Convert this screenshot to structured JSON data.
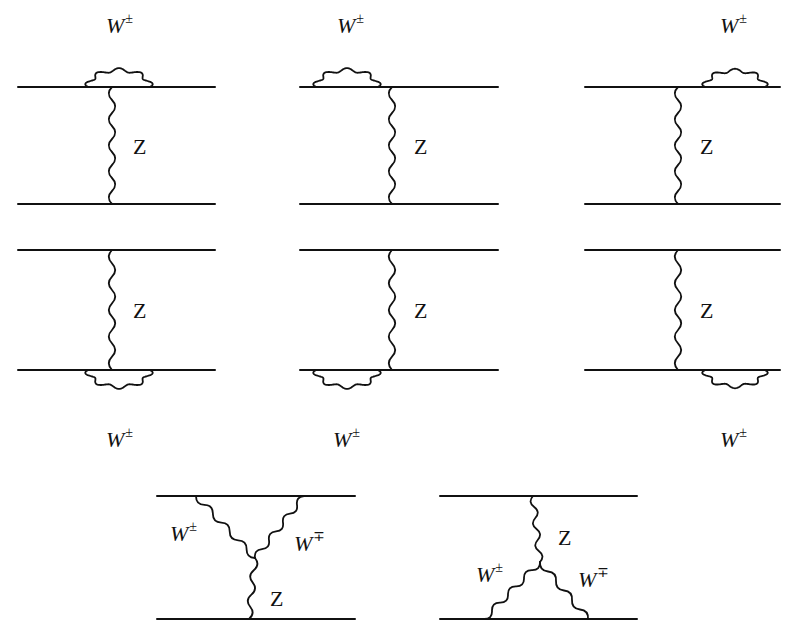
{
  "figure": {
    "stroke_color": "#111111",
    "background": "#ffffff"
  },
  "labels": {
    "w_pm": "W",
    "w_pm_sup": "±",
    "w_mp_sup": "∓",
    "z": "Z"
  },
  "diagrams": [
    {
      "id": "d1",
      "type": "self-energy",
      "x0": 18,
      "x1": 215,
      "yTop": 87,
      "yBot": 204,
      "zx": 112,
      "loop": {
        "line": "top",
        "xa": 88,
        "xb": 150,
        "side": "up"
      },
      "wLabel": {
        "x": 106,
        "y": 14
      },
      "zLabel": {
        "x": 133,
        "y": 136
      }
    },
    {
      "id": "d2",
      "type": "self-energy",
      "x0": 300,
      "x1": 498,
      "yTop": 87,
      "yBot": 204,
      "zx": 392,
      "loop": {
        "line": "top",
        "xa": 316,
        "xb": 378,
        "side": "up"
      },
      "wLabel": {
        "x": 337,
        "y": 14
      },
      "zLabel": {
        "x": 414,
        "y": 136
      }
    },
    {
      "id": "d3",
      "type": "self-energy",
      "x0": 585,
      "x1": 780,
      "yTop": 87,
      "yBot": 204,
      "zx": 678,
      "loop": {
        "line": "top",
        "xa": 705,
        "xb": 765,
        "side": "up"
      },
      "wLabel": {
        "x": 720,
        "y": 14
      },
      "zLabel": {
        "x": 700,
        "y": 136
      }
    },
    {
      "id": "d4",
      "type": "self-energy",
      "x0": 18,
      "x1": 215,
      "yTop": 250,
      "yBot": 370,
      "zx": 112,
      "loop": {
        "line": "bottom",
        "xa": 88,
        "xb": 150,
        "side": "down"
      },
      "wLabel": {
        "x": 106,
        "y": 428
      },
      "zLabel": {
        "x": 133,
        "y": 300
      }
    },
    {
      "id": "d5",
      "type": "self-energy",
      "x0": 300,
      "x1": 498,
      "yTop": 250,
      "yBot": 370,
      "zx": 392,
      "loop": {
        "line": "bottom",
        "xa": 316,
        "xb": 378,
        "side": "down"
      },
      "wLabel": {
        "x": 333,
        "y": 428
      },
      "zLabel": {
        "x": 414,
        "y": 300
      }
    },
    {
      "id": "d6",
      "type": "self-energy",
      "x0": 585,
      "x1": 780,
      "yTop": 250,
      "yBot": 370,
      "zx": 678,
      "loop": {
        "line": "bottom",
        "xa": 705,
        "xb": 765,
        "side": "down"
      },
      "wLabel": {
        "x": 720,
        "y": 428
      },
      "zLabel": {
        "x": 700,
        "y": 300
      }
    },
    {
      "id": "d7",
      "type": "triple-vertex-top",
      "x0": 157,
      "x1": 355,
      "yTop": 496,
      "yBot": 619,
      "vertex": {
        "x": 255,
        "y": 558
      },
      "wa": {
        "x": 196,
        "y": 496
      },
      "wb": {
        "x": 304,
        "y": 496
      },
      "zEnd": {
        "x": 249,
        "y": 619
      },
      "wLabel": {
        "x": 170,
        "y": 522
      },
      "wbLabel": {
        "x": 294,
        "y": 532
      },
      "zLabel": {
        "x": 270,
        "y": 588
      }
    },
    {
      "id": "d8",
      "type": "triple-vertex-bottom",
      "x0": 440,
      "x1": 637,
      "yTop": 496,
      "yBot": 619,
      "vertex": {
        "x": 540,
        "y": 562
      },
      "wa": {
        "x": 484,
        "y": 619
      },
      "wb": {
        "x": 588,
        "y": 619
      },
      "zEnd": {
        "x": 533,
        "y": 496
      },
      "wLabel": {
        "x": 476,
        "y": 563
      },
      "wbLabel": {
        "x": 578,
        "y": 568
      },
      "zLabel": {
        "x": 558,
        "y": 527
      }
    }
  ]
}
